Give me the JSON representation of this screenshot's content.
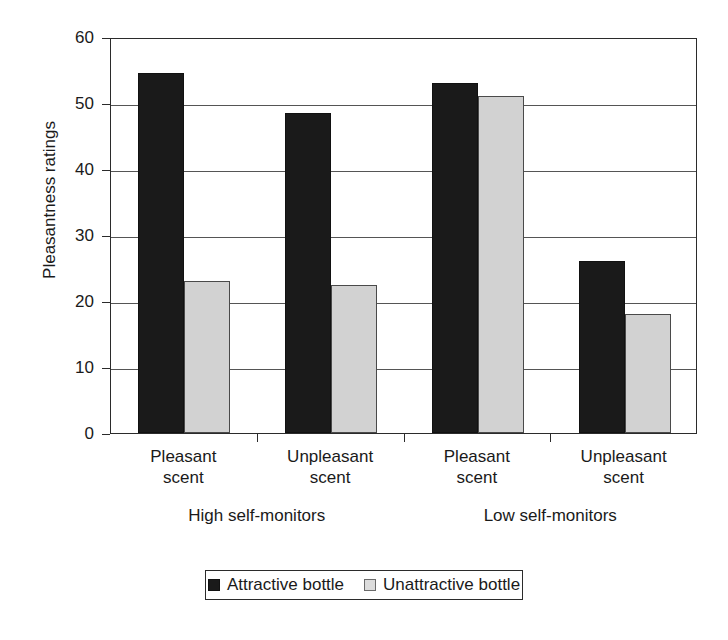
{
  "chart_data": {
    "type": "bar",
    "title": "",
    "xlabel": "",
    "ylabel": "Pleasantness ratings",
    "ylim": [
      0,
      60
    ],
    "ytick_labels": [
      "60",
      "50",
      "40",
      "30",
      "20",
      "10",
      "0"
    ],
    "ytick_values": [
      60,
      50,
      40,
      30,
      20,
      10,
      0
    ],
    "grid": true,
    "legend_position": "bottom",
    "categories": [
      "Pleasant scent",
      "Unpleasant scent",
      "Pleasant scent",
      "Unpleasant scent"
    ],
    "category_lines": [
      [
        "Pleasant",
        "scent"
      ],
      [
        "Unpleasant",
        "scent"
      ],
      [
        "Pleasant",
        "scent"
      ],
      [
        "Unpleasant",
        "scent"
      ]
    ],
    "groups": [
      {
        "label": "High self-monitors",
        "categories": [
          "Pleasant scent",
          "Unpleasant scent"
        ]
      },
      {
        "label": "Low self-monitors",
        "categories": [
          "Pleasant scent",
          "Unpleasant scent"
        ]
      }
    ],
    "series": [
      {
        "name": "Attractive bottle",
        "color": "#1a1a1a",
        "values": [
          54.5,
          48.5,
          53.0,
          26.0
        ]
      },
      {
        "name": "Unattractive bottle",
        "color": "#d2d2d2",
        "values": [
          23.0,
          22.5,
          51.0,
          18.0
        ]
      }
    ]
  },
  "legend": {
    "items": [
      {
        "label": "Attractive bottle",
        "swatch": "dark-square-swatch"
      },
      {
        "label": "Unattractive bottle",
        "swatch": "light-square-swatch"
      }
    ]
  },
  "axes": {
    "y_title": "Pleasantness ratings"
  }
}
